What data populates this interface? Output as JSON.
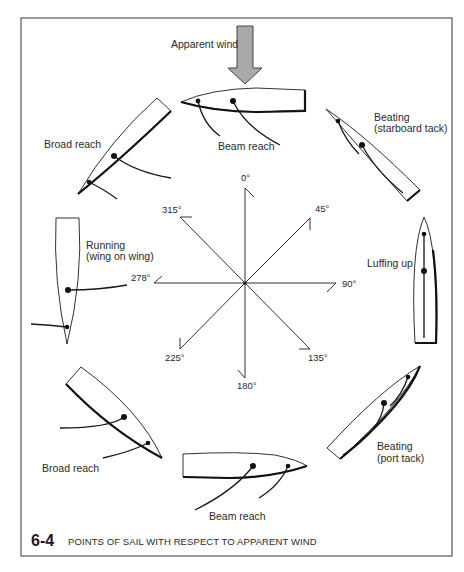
{
  "figure": {
    "number": "6-4",
    "caption": "POINTS OF SAIL WITH  RESPECT TO APPARENT WIND"
  },
  "wind": {
    "label": "Apparent wind",
    "arrow_color": "#a9a9a9"
  },
  "compass": {
    "center": [
      245,
      283
    ],
    "degrees": [
      "0°",
      "45°",
      "90°",
      "135°",
      "180°",
      "225°",
      "278°",
      "315°"
    ]
  },
  "boats": [
    {
      "id": "beam-reach-top",
      "label": "Beam reach"
    },
    {
      "id": "beating-starboard",
      "label_line1": "Beating",
      "label_line2": "(starboard tack)"
    },
    {
      "id": "luffing-up",
      "label": "Luffing up"
    },
    {
      "id": "beating-port",
      "label_line1": "Beating",
      "label_line2": "(port tack)"
    },
    {
      "id": "beam-reach-bottom",
      "label": "Beam reach"
    },
    {
      "id": "broad-reach-bottom",
      "label": "Broad reach"
    },
    {
      "id": "running",
      "label_line1": "Running",
      "label_line2": "(wing on wing)"
    },
    {
      "id": "broad-reach-top",
      "label": "Broad reach"
    }
  ]
}
